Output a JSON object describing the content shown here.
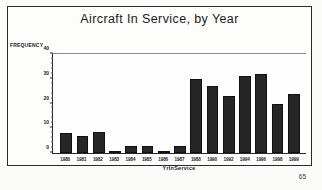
{
  "document": {
    "page_number": "65"
  },
  "chart_data": {
    "type": "bar",
    "title": "Aircraft In Service, by Year",
    "xlabel": "YrInService",
    "ylabel": "FREQUENCY",
    "categories": [
      "1980",
      "1981",
      "1982",
      "1983",
      "1984",
      "1985",
      "1986",
      "1987",
      "1988",
      "1990",
      "1992",
      "1994",
      "1996",
      "1998",
      "1999"
    ],
    "values": [
      8,
      7,
      8.5,
      1,
      3,
      3,
      1,
      3,
      30,
      27,
      23,
      31,
      32,
      20,
      24
    ],
    "ylim": [
      0,
      40
    ],
    "yticks": [
      "0",
      "10",
      "20",
      "30",
      "40"
    ],
    "ytick_values": [
      0,
      10,
      20,
      30,
      40
    ],
    "grid": false,
    "legend": null,
    "bar_color": "#262626"
  }
}
